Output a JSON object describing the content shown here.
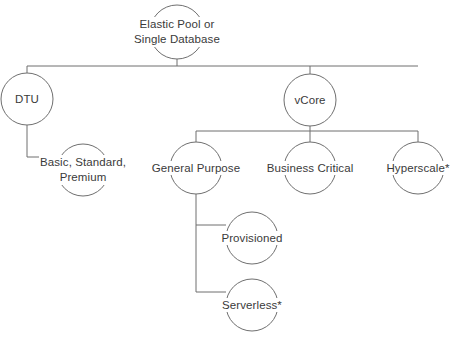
{
  "diagram": {
    "type": "hierarchy-tree",
    "canvas": {
      "width": 455,
      "height": 339,
      "background": "#ffffff"
    },
    "style": {
      "line_color": "#6f6f6f",
      "text_color": "#3a3a3a",
      "node_shape": "circle",
      "node_fill": "none",
      "line_width": 1
    },
    "nodes": [
      {
        "id": "root",
        "label_line1": "Elastic Pool or",
        "label_line2": "Single Database",
        "cx": 177,
        "cy": 32,
        "r": 27,
        "lines": 2,
        "connector": "bottom"
      },
      {
        "id": "dtu",
        "label_line1": "DTU",
        "label_line2": "",
        "cx": 27,
        "cy": 99,
        "r": 26,
        "lines": 1,
        "connector": "top"
      },
      {
        "id": "vcore",
        "label_line1": "vCore",
        "label_line2": "",
        "cx": 310,
        "cy": 100,
        "r": 26,
        "lines": 1,
        "connector": "top"
      },
      {
        "id": "bsp",
        "label_line1": "Basic, Standard,",
        "label_line2": "Premium",
        "cx": 83,
        "cy": 170,
        "r": 26,
        "lines": 2,
        "connector": "left"
      },
      {
        "id": "general-purpose",
        "label_line1": "General Purpose",
        "label_line2": "",
        "cx": 196,
        "cy": 168,
        "r": 26,
        "lines": 1,
        "connector": "top"
      },
      {
        "id": "business-critical",
        "label_line1": "Business Critical",
        "label_line2": "",
        "cx": 310,
        "cy": 168,
        "r": 26,
        "lines": 1,
        "connector": "top"
      },
      {
        "id": "hyperscale",
        "label_line1": "Hyperscale*",
        "label_line2": "",
        "cx": 418,
        "cy": 168,
        "r": 26,
        "lines": 1,
        "connector": "top"
      },
      {
        "id": "provisioned",
        "label_line1": "Provisioned",
        "label_line2": "",
        "cx": 252,
        "cy": 238,
        "r": 26,
        "lines": 1,
        "connector": "left"
      },
      {
        "id": "serverless",
        "label_line1": "Serverless*",
        "label_line2": "",
        "cx": 252,
        "cy": 305,
        "r": 26,
        "lines": 1,
        "connector": "left"
      }
    ],
    "edges": [
      {
        "id": "root-to-bus1",
        "from": "root",
        "to": "bus1",
        "path": "M177,59 L177,66"
      },
      {
        "id": "bus1",
        "from": "bus1-left",
        "to": "bus1-right",
        "path": "M27,66 L418,66"
      },
      {
        "id": "bus1-to-dtu",
        "from": "bus1",
        "to": "dtu",
        "path": "M27,66 L27,73"
      },
      {
        "id": "bus1-to-vcore",
        "from": "bus1",
        "to": "vcore",
        "path": "M310,66 L310,74"
      },
      {
        "id": "dtu-to-bsp",
        "from": "dtu",
        "to": "bsp",
        "path": "M27,125 L27,157 L57,157"
      },
      {
        "id": "vcore-to-bus2",
        "from": "vcore",
        "to": "bus2",
        "path": "M310,126 L310,131"
      },
      {
        "id": "bus2",
        "from": "bus2-left",
        "to": "bus2-right",
        "path": "M196,131 L418,131"
      },
      {
        "id": "bus2-to-gp",
        "from": "bus2",
        "to": "general-purpose",
        "path": "M196,131 L196,142"
      },
      {
        "id": "bus2-to-bc",
        "from": "bus2",
        "to": "business-critical",
        "path": "M310,131 L310,142"
      },
      {
        "id": "bus2-to-hs",
        "from": "bus2",
        "to": "hyperscale",
        "path": "M418,131 L418,142"
      },
      {
        "id": "gp-to-provisioned",
        "from": "general-purpose",
        "to": "provisioned",
        "path": "M196,194 L196,225 L226,225"
      },
      {
        "id": "gp-to-serverless",
        "from": "general-purpose",
        "to": "serverless",
        "path": "M196,225 L196,292 L226,292"
      }
    ],
    "footnote_marker": "*"
  }
}
